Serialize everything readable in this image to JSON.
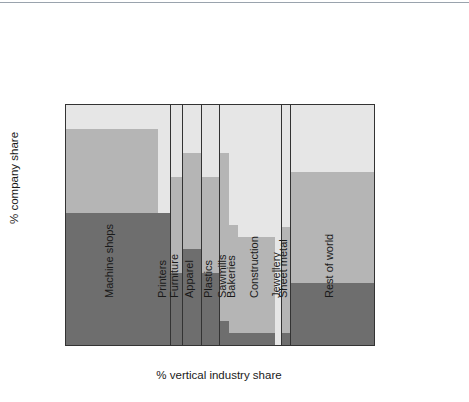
{
  "chart_data": {
    "type": "bar",
    "variant": "marimekko-stacked-100",
    "title": "",
    "xlabel": "% vertical industry share",
    "ylabel": "% company share",
    "xlim": [
      0,
      100
    ],
    "ylim": [
      0,
      100
    ],
    "xticks": [
      0,
      20,
      40,
      60,
      80,
      100
    ],
    "yticks": [
      20,
      40,
      60,
      80,
      100
    ],
    "grid": false,
    "legend_position": "right",
    "series": [
      {
        "name": "Company A",
        "color": "#e6e6e6"
      },
      {
        "name": "Company B",
        "color": "#b5b5b5"
      },
      {
        "name": "Company C",
        "color": "#6e6e6e"
      }
    ],
    "categories": [
      {
        "label": "Machine shops",
        "x_start": 0,
        "x_end": 30,
        "values": {
          "Company A": 10,
          "Company B": 35,
          "Company C": 55
        }
      },
      {
        "label": "Printers",
        "x_start": 30,
        "x_end": 34,
        "values": {
          "Company A": 45,
          "Company B": 0,
          "Company C": 55
        }
      },
      {
        "label": "Furniture",
        "x_start": 34,
        "x_end": 38,
        "values": {
          "Company A": 30,
          "Company B": 40,
          "Company C": 30
        }
      },
      {
        "label": "Apparel",
        "x_start": 38,
        "x_end": 44,
        "values": {
          "Company A": 20,
          "Company B": 40,
          "Company C": 40
        }
      },
      {
        "label": "Plastics",
        "x_start": 44,
        "x_end": 50,
        "values": {
          "Company A": 30,
          "Company B": 40,
          "Company C": 30
        }
      },
      {
        "label": "Sawmills",
        "x_start": 50,
        "x_end": 53,
        "values": {
          "Company A": 20,
          "Company B": 70,
          "Company C": 10
        }
      },
      {
        "label": "Bakeries",
        "x_start": 53,
        "x_end": 56,
        "values": {
          "Company A": 50,
          "Company B": 45,
          "Company C": 5
        }
      },
      {
        "label": "Construction",
        "x_start": 56,
        "x_end": 68,
        "values": {
          "Company A": 55,
          "Company B": 40,
          "Company C": 5
        }
      },
      {
        "label": "Jewellery",
        "x_start": 68,
        "x_end": 70,
        "values": {
          "Company A": 100,
          "Company B": 0,
          "Company C": 0
        }
      },
      {
        "label": "Sheet metal",
        "x_start": 70,
        "x_end": 73,
        "values": {
          "Company A": 51,
          "Company B": 44,
          "Company C": 5
        }
      },
      {
        "label": "Rest of world",
        "x_start": 73,
        "x_end": 100,
        "values": {
          "Company A": 28,
          "Company B": 46,
          "Company C": 26
        }
      }
    ]
  },
  "axis": {
    "y_ticks": [
      "20",
      "40",
      "60",
      "80",
      "100"
    ],
    "x_ticks": [
      "0",
      "20",
      "40",
      "60",
      "80",
      "100"
    ],
    "y_title": "% company share",
    "x_title": "% vertical industry share"
  },
  "legend": {
    "items": [
      {
        "label": "Company A",
        "color": "#e6e6e6"
      },
      {
        "label": "Company B",
        "color": "#b5b5b5"
      },
      {
        "label": "Company C",
        "color": "#6e6e6e"
      }
    ]
  }
}
